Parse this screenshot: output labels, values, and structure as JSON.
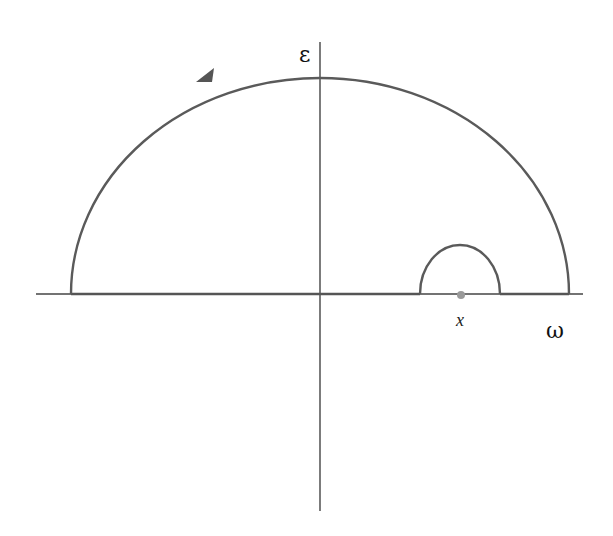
{
  "diagram": {
    "type": "contour-diagram",
    "labels": {
      "vertical_axis": "ε",
      "horizontal_axis": "ω",
      "pole": "x"
    },
    "colors": {
      "background": "#ffffff",
      "axis": "#444444",
      "contour": "#5a5a5a",
      "arrow": "#555555",
      "pole_dot": "#9a9a9a",
      "text": "#111111"
    },
    "elements": {
      "vertical_axis": {
        "x": 320,
        "y_top": 42,
        "y_bottom": 511
      },
      "horizontal_axis": {
        "y": 294,
        "x_left": 36,
        "x_right": 583
      },
      "large_arc": {
        "center_x": 320,
        "center_y": 294,
        "radius_x": 249,
        "radius_y": 216,
        "x_left": 71,
        "x_right": 569,
        "top_y": 78
      },
      "small_semicircle": {
        "center_x": 460,
        "center_y": 294,
        "radius_x": 40,
        "radius_y": 49,
        "x_left": 420,
        "x_right": 500
      },
      "contour_segments": [
        {
          "from_x": 71,
          "to_x": 420,
          "y": 294
        },
        {
          "from_x": 500,
          "to_x": 569,
          "y": 294
        }
      ],
      "direction_arrow": {
        "x": 203,
        "y": 78,
        "direction": "counterclockwise"
      },
      "pole_dot": {
        "x": 461,
        "y": 295,
        "r": 4
      }
    }
  }
}
